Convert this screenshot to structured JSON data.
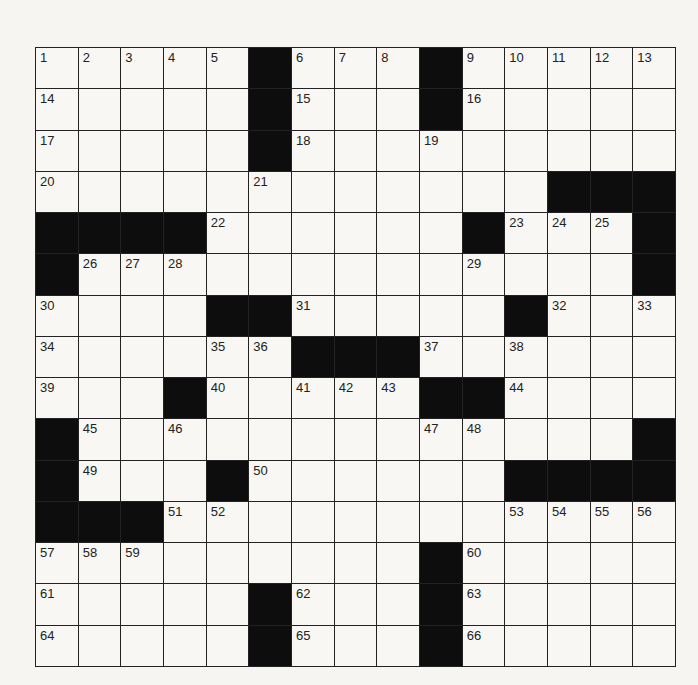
{
  "puzzle": {
    "rows": 15,
    "cols": 15,
    "colors": {
      "black": "#0d0d0d",
      "white": "#f8f7f4",
      "lines": "#222222"
    },
    "black_cells": [
      [
        0,
        5
      ],
      [
        0,
        9
      ],
      [
        1,
        5
      ],
      [
        1,
        9
      ],
      [
        2,
        5
      ],
      [
        3,
        12
      ],
      [
        3,
        13
      ],
      [
        3,
        14
      ],
      [
        4,
        0
      ],
      [
        4,
        1
      ],
      [
        4,
        2
      ],
      [
        4,
        3
      ],
      [
        4,
        10
      ],
      [
        4,
        14
      ],
      [
        5,
        0
      ],
      [
        5,
        14
      ],
      [
        6,
        4
      ],
      [
        6,
        5
      ],
      [
        6,
        11
      ],
      [
        7,
        6
      ],
      [
        7,
        7
      ],
      [
        7,
        8
      ],
      [
        8,
        3
      ],
      [
        8,
        9
      ],
      [
        8,
        10
      ],
      [
        9,
        0
      ],
      [
        9,
        14
      ],
      [
        10,
        0
      ],
      [
        10,
        4
      ],
      [
        10,
        11
      ],
      [
        10,
        12
      ],
      [
        10,
        13
      ],
      [
        10,
        14
      ],
      [
        11,
        0
      ],
      [
        11,
        1
      ],
      [
        11,
        2
      ],
      [
        12,
        9
      ],
      [
        13,
        5
      ],
      [
        13,
        9
      ],
      [
        14,
        5
      ],
      [
        14,
        9
      ]
    ],
    "numbers": [
      {
        "r": 0,
        "c": 0,
        "n": "1"
      },
      {
        "r": 0,
        "c": 1,
        "n": "2"
      },
      {
        "r": 0,
        "c": 2,
        "n": "3"
      },
      {
        "r": 0,
        "c": 3,
        "n": "4"
      },
      {
        "r": 0,
        "c": 4,
        "n": "5"
      },
      {
        "r": 0,
        "c": 6,
        "n": "6"
      },
      {
        "r": 0,
        "c": 7,
        "n": "7"
      },
      {
        "r": 0,
        "c": 8,
        "n": "8"
      },
      {
        "r": 0,
        "c": 10,
        "n": "9"
      },
      {
        "r": 0,
        "c": 11,
        "n": "10"
      },
      {
        "r": 0,
        "c": 12,
        "n": "11"
      },
      {
        "r": 0,
        "c": 13,
        "n": "12"
      },
      {
        "r": 0,
        "c": 14,
        "n": "13"
      },
      {
        "r": 1,
        "c": 0,
        "n": "14"
      },
      {
        "r": 1,
        "c": 6,
        "n": "15"
      },
      {
        "r": 1,
        "c": 10,
        "n": "16"
      },
      {
        "r": 2,
        "c": 0,
        "n": "17"
      },
      {
        "r": 2,
        "c": 6,
        "n": "18"
      },
      {
        "r": 2,
        "c": 9,
        "n": "19"
      },
      {
        "r": 3,
        "c": 0,
        "n": "20"
      },
      {
        "r": 3,
        "c": 5,
        "n": "21"
      },
      {
        "r": 4,
        "c": 4,
        "n": "22"
      },
      {
        "r": 4,
        "c": 11,
        "n": "23"
      },
      {
        "r": 4,
        "c": 12,
        "n": "24"
      },
      {
        "r": 4,
        "c": 13,
        "n": "25"
      },
      {
        "r": 5,
        "c": 1,
        "n": "26"
      },
      {
        "r": 5,
        "c": 2,
        "n": "27"
      },
      {
        "r": 5,
        "c": 3,
        "n": "28"
      },
      {
        "r": 5,
        "c": 10,
        "n": "29"
      },
      {
        "r": 6,
        "c": 0,
        "n": "30"
      },
      {
        "r": 6,
        "c": 6,
        "n": "31"
      },
      {
        "r": 6,
        "c": 12,
        "n": "32"
      },
      {
        "r": 6,
        "c": 14,
        "n": "33"
      },
      {
        "r": 7,
        "c": 0,
        "n": "34"
      },
      {
        "r": 7,
        "c": 4,
        "n": "35"
      },
      {
        "r": 7,
        "c": 5,
        "n": "36"
      },
      {
        "r": 7,
        "c": 9,
        "n": "37"
      },
      {
        "r": 7,
        "c": 11,
        "n": "38"
      },
      {
        "r": 8,
        "c": 0,
        "n": "39"
      },
      {
        "r": 8,
        "c": 4,
        "n": "40"
      },
      {
        "r": 8,
        "c": 6,
        "n": "41"
      },
      {
        "r": 8,
        "c": 7,
        "n": "42"
      },
      {
        "r": 8,
        "c": 8,
        "n": "43"
      },
      {
        "r": 8,
        "c": 11,
        "n": "44"
      },
      {
        "r": 9,
        "c": 1,
        "n": "45"
      },
      {
        "r": 9,
        "c": 3,
        "n": "46"
      },
      {
        "r": 9,
        "c": 9,
        "n": "47"
      },
      {
        "r": 9,
        "c": 10,
        "n": "48"
      },
      {
        "r": 10,
        "c": 1,
        "n": "49"
      },
      {
        "r": 10,
        "c": 5,
        "n": "50"
      },
      {
        "r": 11,
        "c": 3,
        "n": "51"
      },
      {
        "r": 11,
        "c": 4,
        "n": "52"
      },
      {
        "r": 11,
        "c": 11,
        "n": "53"
      },
      {
        "r": 11,
        "c": 12,
        "n": "54"
      },
      {
        "r": 11,
        "c": 13,
        "n": "55"
      },
      {
        "r": 11,
        "c": 14,
        "n": "56"
      },
      {
        "r": 12,
        "c": 0,
        "n": "57"
      },
      {
        "r": 12,
        "c": 1,
        "n": "58"
      },
      {
        "r": 12,
        "c": 2,
        "n": "59"
      },
      {
        "r": 12,
        "c": 10,
        "n": "60"
      },
      {
        "r": 13,
        "c": 0,
        "n": "61"
      },
      {
        "r": 13,
        "c": 6,
        "n": "62"
      },
      {
        "r": 13,
        "c": 10,
        "n": "63"
      },
      {
        "r": 14,
        "c": 0,
        "n": "64"
      },
      {
        "r": 14,
        "c": 6,
        "n": "65"
      },
      {
        "r": 14,
        "c": 10,
        "n": "66"
      }
    ],
    "letters": []
  }
}
